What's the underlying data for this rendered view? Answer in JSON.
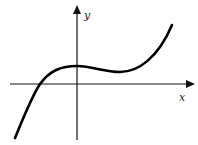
{
  "figure": {
    "type": "function-graph",
    "axes": {
      "x_label": "x",
      "y_label": "y"
    },
    "colors": {
      "curve": "#000000",
      "axes": "#111111",
      "background": "#ffffff"
    },
    "curve_features": {
      "real_roots": 1,
      "root_position": "negative x",
      "local_max_position": "near x = 0, y > 0",
      "local_min_position": "positive x, y > 0",
      "end_behavior": "falls to -infinity on the left, rises to +infinity on the right"
    }
  }
}
